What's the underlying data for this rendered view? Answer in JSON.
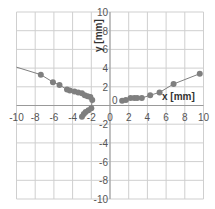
{
  "chart_data": {
    "type": "scatter",
    "title": "",
    "xlabel": "x [mm]",
    "ylabel": "y [mm]",
    "xlim": [
      -10,
      10
    ],
    "ylim": [
      -10,
      10
    ],
    "xticks": [
      -10,
      -8,
      -6,
      -4,
      -2,
      0,
      2,
      4,
      6,
      8,
      10
    ],
    "yticks": [
      -10,
      -8,
      -6,
      -4,
      -2,
      0,
      2,
      4,
      6,
      8,
      10
    ],
    "grid": true,
    "legend": null,
    "series": [
      {
        "name": "left branch",
        "marker": "circle",
        "color": "#7f7f7f",
        "line": true,
        "points": [
          [
            -10,
            4.1
          ],
          [
            -7.4,
            3.3
          ],
          [
            -6.1,
            2.5
          ],
          [
            -5.4,
            2.2
          ],
          [
            -4.6,
            1.7
          ],
          [
            -4.3,
            1.6
          ],
          [
            -3.8,
            1.5
          ],
          [
            -3.4,
            1.4
          ],
          [
            -3.0,
            1.3
          ],
          [
            -2.7,
            1.1
          ],
          [
            -2.4,
            1.0
          ],
          [
            -2.1,
            0.9
          ],
          [
            -1.9,
            0.6
          ],
          [
            -2.0,
            -0.3
          ],
          [
            -2.3,
            -0.5
          ],
          [
            -2.6,
            -0.7
          ],
          [
            -2.8,
            -0.9
          ],
          [
            -3.0,
            -1.2
          ]
        ]
      },
      {
        "name": "right branch",
        "marker": "circle",
        "color": "#7f7f7f",
        "line": true,
        "points": [
          [
            1.3,
            0.5
          ],
          [
            1.7,
            0.6
          ],
          [
            2.2,
            0.8
          ],
          [
            2.6,
            0.8
          ],
          [
            2.9,
            0.8
          ],
          [
            3.4,
            0.8
          ],
          [
            4.3,
            1.1
          ],
          [
            5.3,
            1.4
          ],
          [
            6.8,
            2.3
          ],
          [
            9.6,
            3.4
          ]
        ]
      }
    ]
  }
}
